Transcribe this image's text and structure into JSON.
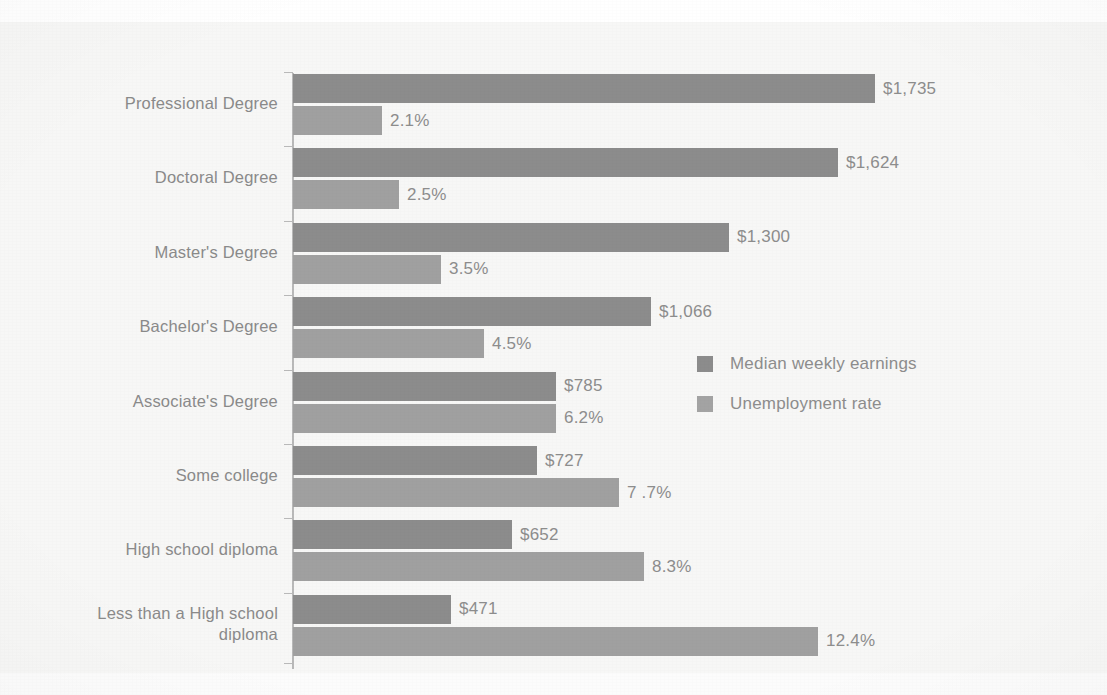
{
  "chart_data": {
    "type": "bar",
    "orientation": "horizontal",
    "title": "",
    "subtitle": "",
    "xlabel": "",
    "ylabel": "",
    "grid": false,
    "legend_position": "middle-right",
    "categories": [
      "Professional Degree",
      "Doctoral Degree",
      "Master's Degree",
      "Bachelor's Degree",
      "Associate's Degree",
      "Some college",
      "High school diploma",
      "Less than a High school\ndiploma"
    ],
    "series": [
      {
        "name": "Median weekly earnings",
        "color": "#8c8c8c",
        "unit": "USD",
        "values": [
          1735,
          1624,
          1300,
          1066,
          785,
          727,
          652,
          471
        ],
        "labels": [
          "$1,735",
          "$1,624",
          "$1,300",
          "$1,066",
          "$785",
          "$727",
          "$652",
          "$471"
        ],
        "axis_max": 1735
      },
      {
        "name": "Unemployment rate",
        "color": "#a0a0a0",
        "unit": "percent",
        "values": [
          2.1,
          2.5,
          3.5,
          4.5,
          6.2,
          7.7,
          8.3,
          12.4
        ],
        "labels": [
          "2.1%",
          "2.5%",
          "3.5%",
          "4.5%",
          "6.2%",
          "7 .7%",
          "8.3%",
          "12.4%"
        ],
        "axis_max": 12.4
      }
    ]
  },
  "legend": {
    "items": [
      {
        "label": "Median weekly earnings",
        "color": "#8c8c8c"
      },
      {
        "label": "Unemployment rate",
        "color": "#a3a3a3"
      }
    ]
  },
  "style": {
    "background": "#f7f7f6",
    "axis_color": "#b9b9b9",
    "text_color": "#8a8a8a",
    "earnings_color": "#8c8c8c",
    "unemployment_color": "#a3a3a3"
  }
}
